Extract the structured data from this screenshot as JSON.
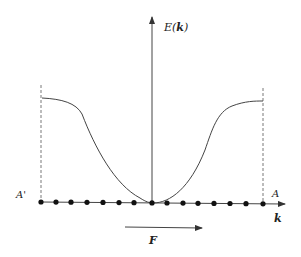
{
  "figure": {
    "type": "band-energy-diagram",
    "y_axis_label": {
      "prefix": "E(",
      "var": "k",
      "suffix": ")"
    },
    "x_axis_label": "k",
    "left_boundary_label": "A'",
    "right_boundary_label": "A",
    "force_label": "F",
    "lattice_points_count": 15,
    "colors": {
      "line": "#333333",
      "dot": "#111111",
      "background": "#ffffff"
    }
  }
}
